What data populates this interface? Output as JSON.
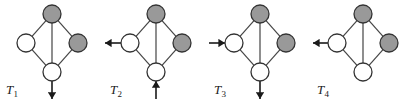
{
  "figure": {
    "width": 415,
    "height": 104,
    "background": "#ffffff",
    "type": "diagram"
  },
  "style": {
    "node_fill_shaded": "#999999",
    "node_fill_open": "#ffffff",
    "node_stroke": "#333333",
    "edge_stroke": "#444444",
    "arrow_stroke": "#1a1a1a",
    "label_color": "#1a1a1a",
    "node_radius": 9,
    "node_stroke_width": 1.3,
    "edge_stroke_width": 1.2
  },
  "graph": {
    "nodes": [
      {
        "id": "top",
        "name": "top-node",
        "cx": 52,
        "cy": 14,
        "fill": "shaded"
      },
      {
        "id": "left",
        "name": "left-node",
        "cx": 26,
        "cy": 43,
        "fill": "open"
      },
      {
        "id": "right",
        "name": "right-node",
        "cx": 78,
        "cy": 43,
        "fill": "shaded"
      },
      {
        "id": "bottom",
        "name": "bottom-node",
        "cx": 52,
        "cy": 72,
        "fill": "open"
      }
    ],
    "edges": [
      {
        "from": "top",
        "to": "left"
      },
      {
        "from": "top",
        "to": "right"
      },
      {
        "from": "left",
        "to": "bottom"
      },
      {
        "from": "right",
        "to": "bottom"
      },
      {
        "from": "top",
        "to": "bottom"
      }
    ]
  },
  "panels": [
    {
      "id": "T1",
      "name": "diagram-t1",
      "x": 0,
      "label": "T",
      "label_sub": "1",
      "label_x": 6,
      "label_y": 82,
      "arrows": [
        {
          "name": "bidirectional-down-arrow",
          "orientation": "vertical",
          "heads": "both",
          "x1": 52,
          "y1": 81,
          "x2": 52,
          "y2": 99
        }
      ]
    },
    {
      "id": "T2",
      "name": "diagram-t2",
      "x": 104,
      "label": "T",
      "label_sub": "2",
      "label_x": 6,
      "label_y": 82,
      "arrows": [
        {
          "name": "outgoing-left-arrow",
          "orientation": "horizontal",
          "heads": "end",
          "x1": 17,
          "y1": 43,
          "x2": 1,
          "y2": 43
        },
        {
          "name": "incoming-up-arrow",
          "orientation": "vertical",
          "heads": "end",
          "x1": 52,
          "y1": 99,
          "x2": 52,
          "y2": 81
        }
      ]
    },
    {
      "id": "T3",
      "name": "diagram-t3",
      "x": 208,
      "label": "T",
      "label_sub": "3",
      "label_x": 6,
      "label_y": 82,
      "arrows": [
        {
          "name": "incoming-right-arrow",
          "orientation": "horizontal",
          "heads": "end",
          "x1": 1,
          "y1": 43,
          "x2": 17,
          "y2": 43
        },
        {
          "name": "outgoing-down-arrow",
          "orientation": "vertical",
          "heads": "end",
          "x1": 52,
          "y1": 81,
          "x2": 52,
          "y2": 99
        }
      ]
    },
    {
      "id": "T4",
      "name": "diagram-t4",
      "x": 311,
      "label": "T",
      "label_sub": "4",
      "label_x": 6,
      "label_y": 82,
      "arrows": [
        {
          "name": "bidirectional-left-arrow",
          "orientation": "horizontal",
          "heads": "both",
          "x1": 17,
          "y1": 43,
          "x2": 2,
          "y2": 43
        }
      ]
    }
  ]
}
